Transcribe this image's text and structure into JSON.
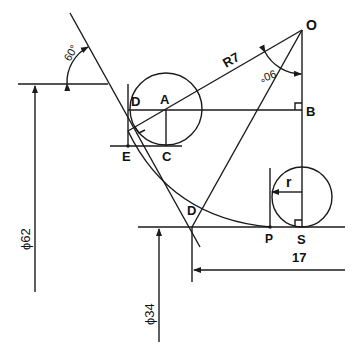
{
  "diagram": {
    "type": "technical-drawing",
    "stroke_color": "#1a1a1a",
    "background": "#ffffff",
    "points": {
      "O": "O",
      "A": "A",
      "B": "B",
      "C": "C",
      "D_upper": "D",
      "E": "E",
      "D_lower": "D",
      "P": "P",
      "S": "S"
    },
    "labels": {
      "radius_large": "R7",
      "radius_small": "r",
      "angle_top": "60°",
      "angle_at_O": "90°"
    },
    "dimensions": {
      "diameter_large": "ϕ62",
      "diameter_small": "ϕ34",
      "length": "17"
    }
  }
}
